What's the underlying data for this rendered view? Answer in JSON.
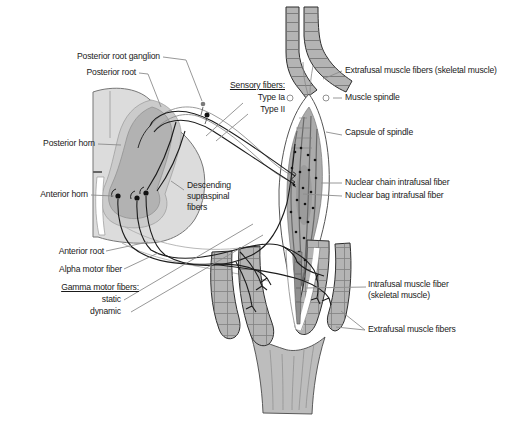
{
  "diagram": {
    "left_labels": {
      "posterior_root_ganglion": "Posterior root ganglion",
      "posterior_root": "Posterior root",
      "posterior_horn": "Posterior horn",
      "anterior_horn": "Anterior horn",
      "anterior_root": "Anterior root",
      "alpha_motor_fiber": "Alpha motor fiber",
      "gamma_heading": "Gamma motor fibers:",
      "gamma_static": "static",
      "gamma_dynamic": "dynamic"
    },
    "center_labels": {
      "descending_supraspinal": "Descending supraspinal fibers",
      "sensory_heading": "Sensory fibers:",
      "sensory_type_ia": "Type Ia",
      "sensory_type_ii": "Type II"
    },
    "right_labels": {
      "extrafusal_top": "Extrafusal muscle fibers (skeletal muscle)",
      "muscle_spindle": "Muscle spindle",
      "capsule_of_spindle": "Capsule of spindle",
      "nuclear_chain": "Nuclear chain intrafusal fiber",
      "nuclear_bag": "Nuclear bag intrafusal fiber",
      "intrafusal_fiber": "Intrafusal muscle fiber (skeletal muscle)",
      "extrafusal_bottom": "Extrafusal muscle fibers"
    },
    "colors": {
      "background": "#ffffff",
      "muscle_fill": "#b4b4b4",
      "muscle_band": "#6f6f6f",
      "muscle_outline": "#2d2d2d",
      "cord_white_matter": "#dcdcdc",
      "cord_gray_matter": "#b2b2b2",
      "cord_gray_light": "#cbcbcb",
      "spindle_core": "#ababab",
      "capsule_white": "#ffffff",
      "nerve_fiber": "#1c1c1c",
      "leader_line": "#8c8c8c",
      "text": "#1a1a1a"
    }
  }
}
